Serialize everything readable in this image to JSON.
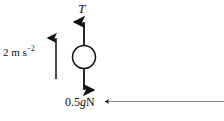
{
  "figure": {
    "kind": "force-diagram",
    "background_color": "#ffffff",
    "stroke_color": "#111111",
    "particle": {
      "shape": "open-circle",
      "fill": "none",
      "center_x": 84,
      "center_y": 57,
      "radius": 11.5
    },
    "labels": {
      "tension": "T",
      "acceleration_value": "2 m s",
      "acceleration_exponent": "−2",
      "weight_prefix": "0.5",
      "weight_symbol": "g",
      "weight_unit": "N"
    },
    "arrows": {
      "tension": {
        "name": "tension-arrow",
        "direction": "up",
        "x": 84,
        "tail_y": 46,
        "head_y": 19
      },
      "weight": {
        "name": "weight-arrow",
        "direction": "down",
        "x": 84,
        "tail_y": 69,
        "head_y": 93
      },
      "acceleration": {
        "name": "acceleration-arrow",
        "direction": "up",
        "x": 56,
        "tail_y": 79,
        "head_y": 35
      },
      "leader": {
        "name": "weight-leader-line",
        "direction": "left",
        "head_x": 104,
        "tail_x": 224,
        "y": 102
      }
    }
  }
}
